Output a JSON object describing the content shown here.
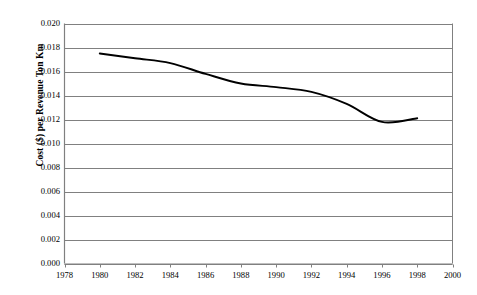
{
  "chart_data": {
    "type": "line",
    "title": "",
    "xlabel": "",
    "ylabel": "Cost ($) per Revenue Ton Km",
    "xlim": [
      1978,
      2000
    ],
    "ylim": [
      0.0,
      0.02
    ],
    "grid": "horizontal",
    "legend": "none",
    "x_ticks": [
      "1978",
      "1980",
      "1982",
      "1984",
      "1986",
      "1988",
      "1990",
      "1992",
      "1994",
      "1996",
      "1998",
      "2000"
    ],
    "y_ticks": [
      "0.000",
      "0.002",
      "0.004",
      "0.006",
      "0.008",
      "0.010",
      "0.012",
      "0.014",
      "0.016",
      "0.018",
      "0.020"
    ],
    "x": [
      1980,
      1982,
      1984,
      1986,
      1988,
      1990,
      1992,
      1994,
      1996,
      1998
    ],
    "values": [
      0.0175,
      0.0171,
      0.0167,
      0.0158,
      0.015,
      0.0147,
      0.0143,
      0.0133,
      0.0118,
      0.0121
    ],
    "series": [
      {
        "name": "Cost per Revenue Ton Km",
        "color": "#000000",
        "x": [
          1980,
          1982,
          1984,
          1986,
          1988,
          1990,
          1992,
          1994,
          1996,
          1998
        ],
        "values": [
          0.0175,
          0.0171,
          0.0167,
          0.0158,
          0.015,
          0.0147,
          0.0143,
          0.0133,
          0.0118,
          0.0121
        ]
      }
    ]
  },
  "style": {
    "plot_border_color": "#808080",
    "gridline_color": "#808080",
    "line_color": "#000000",
    "background": "#ffffff"
  }
}
